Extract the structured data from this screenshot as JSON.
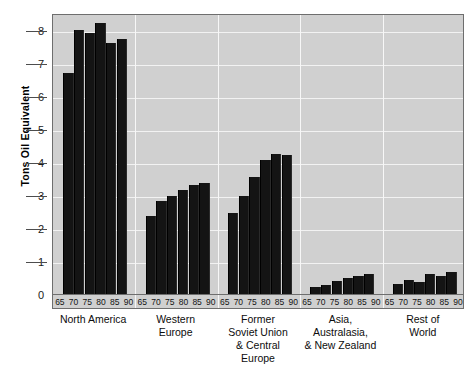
{
  "axis": {
    "y_title": "Tons Oil Equivalent",
    "y_ticks": [
      "8",
      "7",
      "6",
      "5",
      "4",
      "3",
      "2",
      "1",
      "0"
    ]
  },
  "years": [
    "65",
    "70",
    "75",
    "80",
    "85",
    "90"
  ],
  "regions": [
    {
      "name_lines": [
        "North America"
      ]
    },
    {
      "name_lines": [
        "Western",
        "Europe"
      ]
    },
    {
      "name_lines": [
        "Former",
        "Soviet Union",
        "& Central",
        "Europe"
      ]
    },
    {
      "name_lines": [
        "Asia,",
        "Australasia,",
        "& New Zealand"
      ]
    },
    {
      "name_lines": [
        "Rest of",
        "World"
      ]
    }
  ],
  "chart_data": {
    "type": "bar",
    "title": "",
    "xlabel": "",
    "ylabel": "Tons Oil Equivalent",
    "ylim": [
      0,
      8.5
    ],
    "yticks": [
      0,
      1,
      2,
      3,
      4,
      5,
      6,
      7,
      8
    ],
    "grid": true,
    "legend": "none",
    "categories": [
      "65",
      "70",
      "75",
      "80",
      "85",
      "90"
    ],
    "group_axis": "region",
    "groups": [
      {
        "name": "North America",
        "values": [
          6.7,
          8.0,
          7.9,
          8.2,
          7.6,
          7.7
        ]
      },
      {
        "name": "Western Europe",
        "values": [
          2.35,
          2.8,
          2.95,
          3.15,
          3.3,
          3.35
        ]
      },
      {
        "name": "Former Soviet Union & Central Europe",
        "values": [
          2.45,
          2.95,
          3.55,
          4.05,
          4.25,
          4.2
        ]
      },
      {
        "name": "Asia, Australasia, & New Zealand",
        "values": [
          0.2,
          0.28,
          0.4,
          0.47,
          0.54,
          0.6
        ]
      },
      {
        "name": "Rest of World",
        "values": [
          0.3,
          0.43,
          0.36,
          0.6,
          0.56,
          0.67
        ]
      }
    ]
  },
  "colors": {
    "bar": "#141414",
    "plot_background": "#d0d0d0",
    "gridline": "#f2f2f2",
    "page_background": "#ffffff"
  }
}
